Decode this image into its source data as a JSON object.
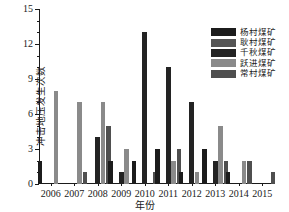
{
  "chart_data": {
    "type": "bar",
    "title": "",
    "xlabel": "年份",
    "ylabel": "冲击地压发生次数",
    "categories": [
      "2006",
      "2007",
      "2008",
      "2009",
      "2010",
      "2011",
      "2012",
      "2013",
      "2014",
      "2015"
    ],
    "ylim": [
      0,
      15
    ],
    "yticks": [
      0,
      3,
      6,
      9,
      12,
      15
    ],
    "ytick_labels": [
      "0",
      "3",
      "6",
      "9",
      "12",
      "15"
    ],
    "grid": false,
    "legend_position": "upper right",
    "series": [
      {
        "name": "杨村煤矿",
        "color": "#1c1c1c",
        "values": [
          2,
          0,
          0,
          2,
          2,
          3,
          1,
          3,
          1,
          0
        ]
      },
      {
        "name": "耿村煤矿",
        "color": "#555555",
        "values": [
          0,
          0,
          0,
          0,
          0,
          0,
          0,
          0,
          0,
          0
        ]
      },
      {
        "name": "千秋煤矿",
        "color": "#232323",
        "values": [
          0,
          0,
          4,
          1,
          13,
          10,
          7,
          2,
          0,
          0
        ]
      },
      {
        "name": "跃进煤矿",
        "color": "#8a8a8a",
        "values": [
          8,
          7,
          7,
          3,
          0,
          2,
          1,
          5,
          2,
          0
        ]
      },
      {
        "name": "常村煤矿",
        "color": "#4f4f4f",
        "values": [
          0,
          1,
          5,
          0,
          1,
          3,
          0,
          2,
          2,
          1
        ]
      }
    ]
  },
  "axis": {
    "y_title": "冲击地压发生次数",
    "x_title": "年份"
  }
}
